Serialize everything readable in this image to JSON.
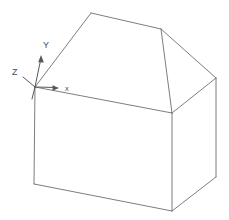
{
  "scene": {
    "title": "3D house solid with coordinate axis triad",
    "background_color": "#ffffff",
    "edge_color": "#6e6e72",
    "axis_color": "#575760",
    "label_color": "#4a4a50",
    "width": 229,
    "height": 220
  },
  "axes": {
    "origin": {
      "x": 35,
      "y": 87
    },
    "items": [
      {
        "name": "y-axis",
        "label": "Y",
        "label_x": 43,
        "label_y": 47,
        "from": {
          "x": 35,
          "y": 87
        },
        "to": {
          "x": 41,
          "y": 56
        },
        "arrow": "up"
      },
      {
        "name": "z-axis",
        "label": "Z",
        "label_x": 13,
        "label_y": 75,
        "from": {
          "x": 35,
          "y": 87
        },
        "to": {
          "x": 22,
          "y": 76
        },
        "arrow": "up-left"
      },
      {
        "name": "x-axis",
        "label": "x",
        "label_x": 65,
        "label_y": 91,
        "from": {
          "x": 35,
          "y": 87
        },
        "to": {
          "x": 58,
          "y": 87
        },
        "arrow": "right"
      }
    ]
  },
  "model": {
    "name": "house",
    "vertices": {
      "ridge_left": {
        "x": 91,
        "y": 13
      },
      "ridge_right": {
        "x": 161,
        "y": 29
      },
      "eave_front_left": {
        "x": 35,
        "y": 87
      },
      "eave_front_right": {
        "x": 172,
        "y": 113
      },
      "eave_back_right": {
        "x": 216,
        "y": 78
      },
      "base_front_left": {
        "x": 34,
        "y": 184
      },
      "base_front_right": {
        "x": 172,
        "y": 211
      },
      "base_back_right": {
        "x": 216,
        "y": 177
      }
    },
    "edges": [
      {
        "name": "roof-ridge",
        "from": "ridge_left",
        "to": "ridge_right"
      },
      {
        "name": "roof-hip-front-left",
        "from": "ridge_left",
        "to": "eave_front_left"
      },
      {
        "name": "roof-hip-back-right",
        "from": "ridge_right",
        "to": "eave_back_right"
      },
      {
        "name": "roof-hip-front-right",
        "from": "ridge_right",
        "to": "eave_front_right"
      },
      {
        "name": "eave-front",
        "from": "eave_front_left",
        "to": "eave_front_right"
      },
      {
        "name": "eave-right",
        "from": "eave_front_right",
        "to": "eave_back_right"
      },
      {
        "name": "wall-edge-left",
        "from": "eave_front_left",
        "to": "base_front_left"
      },
      {
        "name": "wall-edge-front",
        "from": "eave_front_right",
        "to": "base_front_right"
      },
      {
        "name": "wall-edge-right",
        "from": "eave_back_right",
        "to": "base_back_right"
      },
      {
        "name": "base-front",
        "from": "base_front_left",
        "to": "base_front_right"
      },
      {
        "name": "base-right",
        "from": "base_front_right",
        "to": "base_back_right"
      }
    ]
  }
}
